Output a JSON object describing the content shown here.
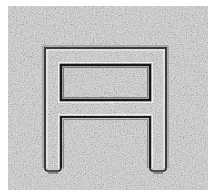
{
  "image": {
    "description": "Grainy grayscale photo of an embossed squared letter A shape",
    "glyph": "A",
    "background_color": "#c9c9c9",
    "surface_light": "#e6e6e6",
    "edge_dark": "#1e1e1e",
    "edge_mid": "#5a5a5a",
    "edge_light": "#f4f4f4"
  }
}
